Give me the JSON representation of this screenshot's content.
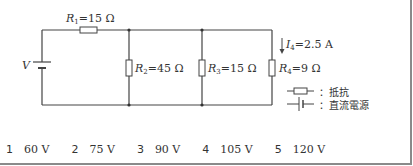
{
  "circuit": {
    "source_label": "V",
    "resistors": [
      {
        "name": "R",
        "sub": "1",
        "value": "=15 Ω"
      },
      {
        "name": "R",
        "sub": "2",
        "value": "=45 Ω"
      },
      {
        "name": "R",
        "sub": "3",
        "value": "=15 Ω"
      },
      {
        "name": "R",
        "sub": "4",
        "value": "=9 Ω"
      }
    ],
    "current": {
      "name": "I",
      "sub": "4",
      "value": "=2.5 A"
    }
  },
  "legend": {
    "resistor_label": "：抵抗",
    "dc_source_label": "：直流電源"
  },
  "choices": [
    {
      "num": "1",
      "value": "60 V"
    },
    {
      "num": "2",
      "value": "75 V"
    },
    {
      "num": "3",
      "value": "90 V"
    },
    {
      "num": "4",
      "value": "105 V"
    },
    {
      "num": "5",
      "value": "120 V"
    }
  ]
}
